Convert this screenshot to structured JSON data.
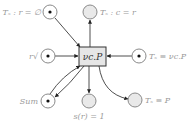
{
  "diagram": {
    "type": "petri-net",
    "transition": {
      "label": "νc.P"
    },
    "places": [
      {
        "id": "top-left",
        "label": "Tₛ : r = ∅",
        "marked": true
      },
      {
        "id": "top-center",
        "label": "Tₛ : c = r",
        "marked": false
      },
      {
        "id": "left",
        "label": "r√",
        "marked": true
      },
      {
        "id": "right",
        "label": "Tₛ ≡ νc.P",
        "marked": true
      },
      {
        "id": "bottom-left",
        "label": "Sum",
        "marked": true
      },
      {
        "id": "bottom-center",
        "label": "s(r) = 1",
        "marked": false
      },
      {
        "id": "bottom-right",
        "label": "Tₛ ≡ P",
        "marked": false
      }
    ]
  }
}
